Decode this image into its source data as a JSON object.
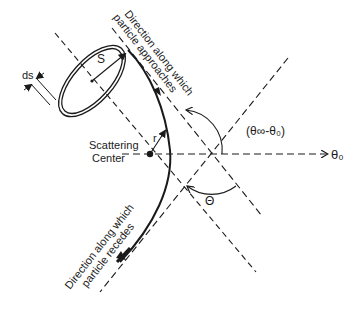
{
  "diagram": {
    "colors": {
      "ink": "#1a1a1a",
      "background": "#ffffff"
    },
    "labels": {
      "approach_direction_line1": "Direction along which",
      "approach_direction_line2": "particle approaches",
      "recede_direction_line1": "Direction along which",
      "recede_direction_line2": "particle recedes",
      "scattering_center_line1": "Scattering",
      "scattering_center_line2": "Center",
      "ds": "ds",
      "s": "S",
      "r": "r",
      "theta_zero": "θ₀",
      "angle_difference": "(θ∞-θ₀)",
      "scattering_angle": "Θ"
    },
    "elements": {
      "ring": "annular cross-section (impact ring) of width ds at radius S",
      "trajectory": "hyperbolic-like particle path bending around scattering center",
      "axes": [
        "approach asymptote",
        "recede asymptote",
        "reference axis θ₀",
        "symmetry line"
      ]
    }
  }
}
